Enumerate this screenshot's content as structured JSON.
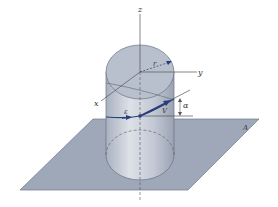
{
  "figure": {
    "labels": {
      "z_axis": "z",
      "y_axis": "y",
      "x_axis": "x",
      "radius": "r",
      "unit_vector": "ε",
      "velocity": "V",
      "angle": "α",
      "plane": "A"
    },
    "colors": {
      "plane_fill": "#9ea8b8",
      "cylinder_fill": "#c7cdd8",
      "cylinder_top": "#b9c0cd",
      "line": "#555555",
      "vector": "#2a3f7a"
    }
  }
}
